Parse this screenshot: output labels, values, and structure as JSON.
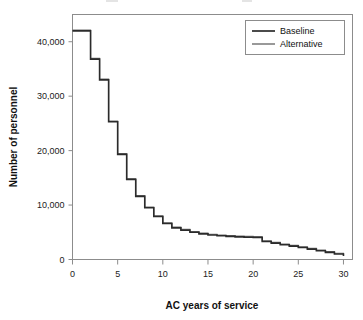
{
  "chart_data": {
    "type": "line",
    "subtype": "step",
    "title": "",
    "xlabel": "AC years of service",
    "ylabel": "Number of personnel",
    "xlim": [
      0,
      31
    ],
    "ylim": [
      0,
      45000
    ],
    "xticks": [
      0,
      5,
      10,
      15,
      20,
      25,
      30
    ],
    "xticklabels": [
      "0",
      "5",
      "10",
      "15",
      "20",
      "25",
      "30"
    ],
    "yticks": [
      0,
      10000,
      20000,
      30000,
      40000
    ],
    "yticklabels": [
      "0",
      "10,000",
      "20,000",
      "30,000",
      "40,000"
    ],
    "grid": false,
    "legend_position": "top-right",
    "x": [
      0,
      1,
      2,
      3,
      4,
      5,
      6,
      7,
      8,
      9,
      10,
      11,
      12,
      13,
      14,
      15,
      16,
      17,
      18,
      19,
      20,
      21,
      22,
      23,
      24,
      25,
      26,
      27,
      28,
      29,
      30
    ],
    "series": [
      {
        "name": "Baseline",
        "color": "#2b2b2b",
        "values": [
          42000,
          42000,
          36800,
          33000,
          25300,
          19300,
          14700,
          11600,
          9500,
          7900,
          6600,
          5800,
          5400,
          5000,
          4700,
          4500,
          4350,
          4250,
          4150,
          4100,
          4050,
          3300,
          3000,
          2700,
          2450,
          2200,
          1900,
          1600,
          1300,
          1000,
          620
        ]
      },
      {
        "name": "Alternative",
        "color": "#6e6e6e",
        "values": [
          42000,
          42000,
          36800,
          33000,
          25300,
          19300,
          14700,
          11600,
          9500,
          7900,
          6600,
          5800,
          5400,
          5000,
          4700,
          4500,
          4350,
          4250,
          4150,
          4100,
          4050,
          3300,
          3000,
          2700,
          2450,
          2200,
          1900,
          1600,
          1300,
          1000,
          620
        ]
      }
    ]
  },
  "legend": {
    "entries": [
      {
        "label": "Baseline"
      },
      {
        "label": "Alternative"
      }
    ]
  }
}
